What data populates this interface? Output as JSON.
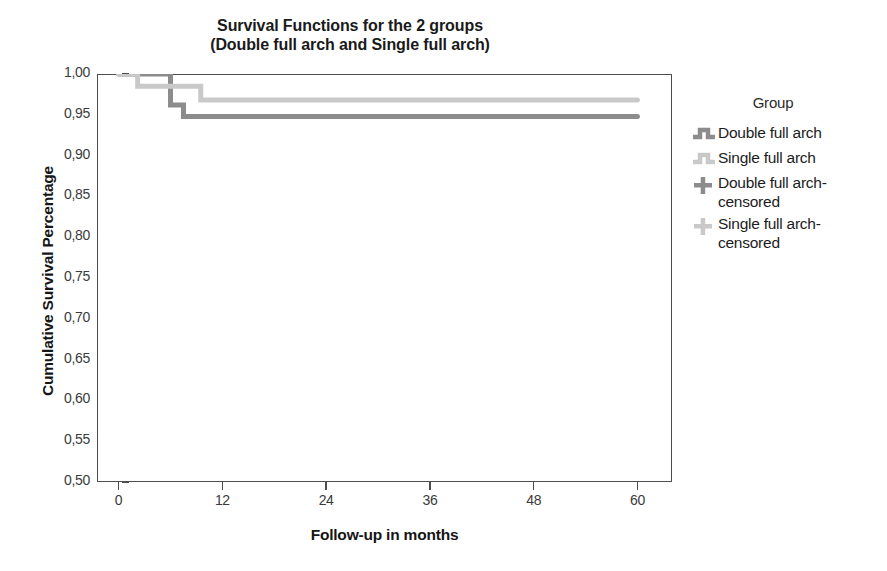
{
  "chart_data": {
    "type": "line",
    "title": "Survival Functions for the 2 groups\n(Double full arch and Single full arch)",
    "title_line1": "Survival Functions for the 2 groups",
    "title_line2": "(Double full arch and Single full arch)",
    "xlabel": "Follow-up in months",
    "ylabel": "Cumulative Survival Percentage",
    "xlim": [
      -2.5,
      64
    ],
    "ylim": [
      0.5,
      1.0
    ],
    "xticks": [
      0,
      12,
      24,
      36,
      48,
      60
    ],
    "xtick_labels": [
      "0",
      "12",
      "24",
      "36",
      "48",
      "60"
    ],
    "yticks": [
      0.5,
      0.55,
      0.6,
      0.65,
      0.7,
      0.75,
      0.8,
      0.85,
      0.9,
      0.95,
      1.0
    ],
    "ytick_labels": [
      "0,50",
      "0,55",
      "0,60",
      "0,65",
      "0,70",
      "0,75",
      "0,80",
      "0,85",
      "0,90",
      "0,95",
      "1,00"
    ],
    "grid": false,
    "legend_position": "right",
    "legend_title": "Group",
    "series": [
      {
        "name": "Double full arch",
        "color": "#8c8c8c",
        "style": "step-post",
        "x": [
          0,
          6,
          6,
          7.5,
          7.5,
          60
        ],
        "y": [
          1.0,
          1.0,
          0.962,
          0.962,
          0.948,
          0.948
        ]
      },
      {
        "name": "Single full arch",
        "color": "#c9c9c9",
        "style": "step-post",
        "x": [
          0,
          2.2,
          2.2,
          9.5,
          9.5,
          60
        ],
        "y": [
          1.0,
          1.0,
          0.985,
          0.985,
          0.968,
          0.968
        ]
      }
    ],
    "legend_entries": [
      {
        "label": "Double full arch",
        "color": "#8c8c8c",
        "marker": "step-line"
      },
      {
        "label": "Single full arch",
        "color": "#c9c9c9",
        "marker": "step-line"
      },
      {
        "label": "Double full arch-\ncensored",
        "color": "#8c8c8c",
        "marker": "plus"
      },
      {
        "label": "Single full arch-\ncensored",
        "color": "#c9c9c9",
        "marker": "plus"
      }
    ]
  },
  "colors": {
    "double_full_arch": "#8c8c8c",
    "single_full_arch": "#c9c9c9",
    "axis": "#4d4d4d",
    "text": "#1a1a1a",
    "background": "#ffffff"
  }
}
